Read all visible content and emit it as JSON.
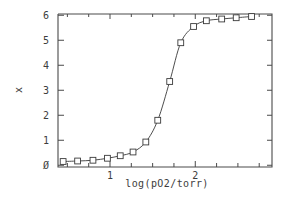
{
  "chart_data": {
    "type": "scatter",
    "title": "",
    "subtitle": "",
    "xlabel": "log(pO2/torr)",
    "ylabel": "x",
    "ylabel_glyph": "x",
    "xlim": [
      0.39,
      2.9
    ],
    "ylim": [
      -0.07,
      6.05
    ],
    "xticklabels": [
      "1",
      "2"
    ],
    "xtickvalues": [
      1,
      2
    ],
    "xminorticks": [
      0.5,
      0.75,
      1.25,
      1.5,
      1.75,
      2.25,
      2.5,
      2.75
    ],
    "yticklabels": [
      "0",
      "1",
      "2",
      "3",
      "4",
      "5",
      "6"
    ],
    "ytickvalues": [
      0,
      1,
      2,
      3,
      4,
      5,
      6
    ],
    "grid": false,
    "legend": false,
    "legend_position": "none",
    "marker": "open-square",
    "line_style": "solid",
    "series": [
      {
        "name": "binding isotherm",
        "x": [
          0.45,
          0.62,
          0.8,
          0.97,
          1.12,
          1.27,
          1.42,
          1.56,
          1.7,
          1.83,
          1.98,
          2.13,
          2.31,
          2.48,
          2.66
        ],
        "y": [
          0.15,
          0.17,
          0.2,
          0.28,
          0.38,
          0.53,
          0.93,
          1.8,
          3.35,
          4.9,
          5.55,
          5.78,
          5.85,
          5.9,
          5.95
        ]
      }
    ],
    "colors": {
      "axis": "#4a4a4a",
      "curve": "#3a3a3a",
      "marker_fill": "#ffffff",
      "marker_edge": "#3a3a3a",
      "text": "#3d3d3d",
      "background": "#ffffff"
    }
  }
}
